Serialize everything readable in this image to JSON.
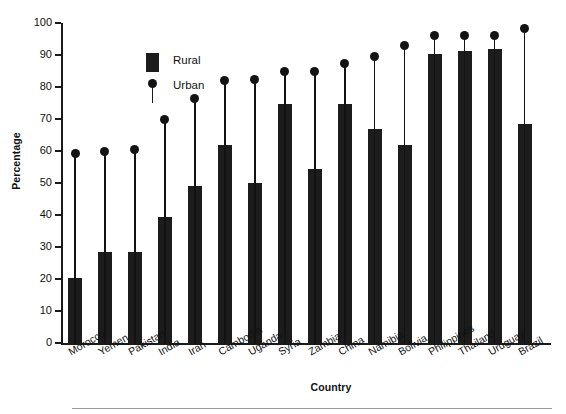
{
  "chart_data": {
    "type": "bar",
    "title": "",
    "xlabel": "Country",
    "ylabel": "Percentage",
    "ylim": [
      0,
      100
    ],
    "yticks": [
      0,
      10,
      20,
      30,
      40,
      50,
      60,
      70,
      80,
      90,
      100
    ],
    "grid": false,
    "legend_position": "upper-left-inside",
    "categories": [
      "Morocco",
      "Yemen",
      "Pakistan",
      "India",
      "Iran",
      "Cambodia",
      "Uganda",
      "Syria",
      "Zambia",
      "China",
      "Namibia",
      "Bolivia",
      "Philippines",
      "Thailand",
      "Uruguay",
      "Brazil"
    ],
    "series": [
      {
        "name": "Rural",
        "marker": "bar",
        "color": "#1c1c1c",
        "values": [
          20.6,
          28.8,
          28.6,
          39.7,
          49.5,
          62.2,
          50.2,
          75.0,
          54.8,
          75.0,
          67.2,
          62.2,
          90.6,
          91.5,
          92.3,
          68.8
        ]
      },
      {
        "name": "Urban",
        "marker": "dot-with-stem",
        "color": "#131313",
        "values": [
          59.2,
          59.7,
          60.6,
          69.9,
          76.5,
          82.0,
          82.5,
          84.8,
          84.8,
          87.4,
          89.6,
          93.0,
          96.0,
          96.0,
          96.2,
          98.3
        ]
      }
    ]
  },
  "legend": {
    "entries": [
      {
        "label": "Rural",
        "icon": "filled-square-swatch"
      },
      {
        "label": "Urban",
        "icon": "dot-with-stem-swatch"
      }
    ]
  },
  "axes": {
    "y_title": "Percentage",
    "x_title": "Country"
  }
}
